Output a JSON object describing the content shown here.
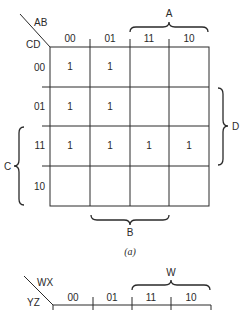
{
  "map_a": {
    "row_var": "CD",
    "col_var": "AB",
    "col_labels": [
      "00",
      "01",
      "11",
      "10"
    ],
    "row_labels": [
      "00",
      "01",
      "11",
      "10"
    ],
    "cells": [
      [
        "1",
        "1",
        "",
        ""
      ],
      [
        "1",
        "1",
        "",
        ""
      ],
      [
        "1",
        "1",
        "1",
        "1"
      ],
      [
        "",
        "",
        "",
        ""
      ]
    ],
    "brace_top": "A",
    "brace_right": "D",
    "brace_left": "C",
    "brace_bottom": "B",
    "caption": "(a)"
  },
  "map_b": {
    "row_var": "YZ",
    "col_var": "WX",
    "col_labels": [
      "00",
      "01",
      "11",
      "10"
    ],
    "brace_top": "W"
  }
}
